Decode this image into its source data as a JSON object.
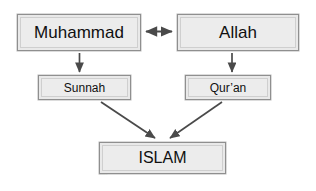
{
  "diagram": {
    "type": "flow-diagram",
    "background_color": "#ffffff",
    "box_fill_color": "#ececec",
    "box_border_color": "#8f8f8f",
    "arrow_color": "#4a4a4a",
    "text_color": "#101010",
    "nodes": [
      {
        "id": "muhammad",
        "label": "Muhammad"
      },
      {
        "id": "allah",
        "label": "Allah"
      },
      {
        "id": "sunnah",
        "label": "Sunnah"
      },
      {
        "id": "quran",
        "label": "Qur’an"
      },
      {
        "id": "islam",
        "label": "ISLAM"
      }
    ],
    "connections": [
      {
        "from": "muhammad",
        "to": "allah",
        "style": "double-headed-arrow"
      },
      {
        "from": "muhammad",
        "to": "sunnah",
        "style": "arrow-down"
      },
      {
        "from": "allah",
        "to": "quran",
        "style": "arrow-down"
      },
      {
        "from": "sunnah",
        "to": "islam",
        "style": "arrow-diagonal"
      },
      {
        "from": "quran",
        "to": "islam",
        "style": "arrow-diagonal"
      }
    ],
    "caption": "········"
  }
}
